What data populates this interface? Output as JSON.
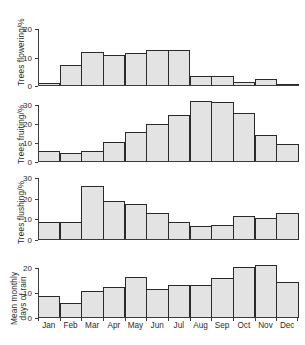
{
  "figure": {
    "title": "",
    "months": [
      "Jan",
      "Feb",
      "Mar",
      "Apr",
      "May",
      "Jun",
      "Jul",
      "Aug",
      "Sep",
      "Oct",
      "Nov",
      "Dec"
    ]
  },
  "chart_data": [
    {
      "type": "bar",
      "title": "",
      "ylabel": "Trees flowering/%",
      "xlabel": "",
      "categories": [
        "Jan",
        "Feb",
        "Mar",
        "Apr",
        "May",
        "Jun",
        "Jul",
        "Aug",
        "Sep",
        "Oct",
        "Nov",
        "Dec"
      ],
      "values": [
        1,
        7.5,
        12,
        11,
        11.5,
        12.8,
        12.8,
        3.5,
        3.5,
        1.5,
        2.5,
        0.5
      ],
      "ylim": [
        0,
        24
      ],
      "yticks": [
        0,
        10,
        20
      ],
      "ytick_labels": [
        "0",
        "10",
        "20"
      ],
      "grid": false,
      "legend": "none"
    },
    {
      "type": "bar",
      "title": "",
      "ylabel": "Trees fruiting/%",
      "xlabel": "",
      "categories": [
        "Jan",
        "Feb",
        "Mar",
        "Apr",
        "May",
        "Jun",
        "Jul",
        "Aug",
        "Sep",
        "Oct",
        "Nov",
        "Dec"
      ],
      "values": [
        5.7,
        4.6,
        5.7,
        10.4,
        15.7,
        19.7,
        24.6,
        32,
        31.2,
        25.7,
        14.2,
        9.2
      ],
      "ylim": [
        0,
        34
      ],
      "yticks": [
        0,
        10,
        20,
        30
      ],
      "ytick_labels": [
        "0",
        "10",
        "20",
        "30"
      ],
      "grid": false,
      "legend": "none"
    },
    {
      "type": "bar",
      "title": "",
      "ylabel": "Trees flushing/%",
      "xlabel": "",
      "categories": [
        "Jan",
        "Feb",
        "Mar",
        "Apr",
        "May",
        "Jun",
        "Jul",
        "Aug",
        "Sep",
        "Oct",
        "Nov",
        "Dec"
      ],
      "values": [
        8.8,
        8.8,
        26,
        18.7,
        17.5,
        12.9,
        8.9,
        6.8,
        7.5,
        11.7,
        10.6,
        13.1
      ],
      "ylim": [
        0,
        31
      ],
      "yticks": [
        0,
        10,
        20,
        30
      ],
      "ytick_labels": [
        "0",
        "10",
        "20",
        "30"
      ],
      "grid": false,
      "legend": "none"
    },
    {
      "type": "bar",
      "title": "",
      "ylabel": "Mean monthly days of rain",
      "ylabel_line1": "Mean monthly",
      "ylabel_line2": "days of rain",
      "xlabel": "",
      "categories": [
        "Jan",
        "Feb",
        "Mar",
        "Apr",
        "May",
        "Jun",
        "Jul",
        "Aug",
        "Sep",
        "Oct",
        "Nov",
        "Dec"
      ],
      "values": [
        9,
        5.9,
        10.9,
        12.4,
        16.4,
        11.5,
        13.4,
        13.4,
        15.9,
        20.5,
        21.4,
        14.5
      ],
      "ylim": [
        0,
        24
      ],
      "yticks": [
        0,
        10,
        20
      ],
      "ytick_labels": [
        "0",
        "10",
        "20"
      ],
      "grid": false,
      "legend": "none"
    }
  ],
  "style": {
    "bar_fill": "#e3e3e3",
    "bar_edge": "#2a2a2a",
    "axis_color": "#3b3b3b",
    "text_color": "#2b2b2b",
    "background": "#ffffff"
  }
}
